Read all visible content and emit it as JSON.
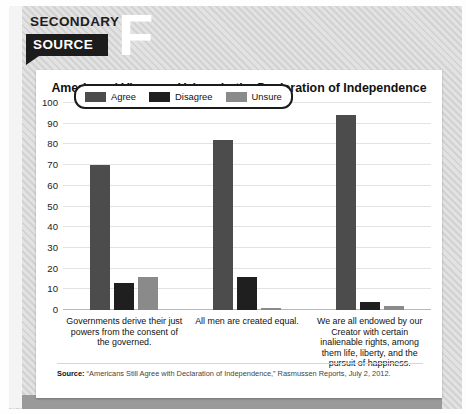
{
  "badge": {
    "line1": "SECONDARY",
    "line2": "SOURCE",
    "letter": "F"
  },
  "card": {
    "title": "Americans' Views on Values in the Declaration of Independence",
    "source_prefix": "Source:",
    "source_text": "“Americans Still Agree with Declaration of Independence,” Rasmussen Reports, July 2, 2012."
  },
  "colors": {
    "agree": "#4c4c4c",
    "disagree": "#1f1f1f",
    "unsure": "#8a8a8a",
    "gridline": "#e3e3e3",
    "axis": "#b9b9b9",
    "badge_dark": "#1c1c1c",
    "card_background": "#ffffff"
  },
  "chart_data": {
    "type": "bar",
    "title": "Americans' Views on Values in the Declaration of Independence",
    "xlabel": "",
    "ylabel": "",
    "ylim": [
      0,
      100
    ],
    "yticks": [
      100,
      90,
      80,
      70,
      60,
      50,
      40,
      30,
      20,
      10,
      0
    ],
    "grid": true,
    "legend_position": "top-left",
    "categories": [
      "Governments derive their just powers from the consent of the governed.",
      "All men are created equal.",
      "We are all endowed by our Creator with certain inalienable rights, among them life, liberty, and the pursuit of happiness."
    ],
    "series": [
      {
        "name": "Agree",
        "values": [
          70,
          82,
          94
        ]
      },
      {
        "name": "Disagree",
        "values": [
          13,
          16,
          4
        ]
      },
      {
        "name": "Unsure",
        "values": [
          16,
          1,
          2
        ]
      }
    ]
  }
}
